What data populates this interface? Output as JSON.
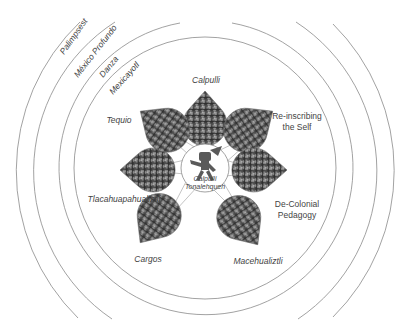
{
  "diagram": {
    "rings": [
      {
        "label": "Mexicayotl",
        "radius": 131
      },
      {
        "label": "Danza",
        "radius": 147
      },
      {
        "label": "México Profundo",
        "radius": 178
      },
      {
        "label": "Palimpsest",
        "radius": 206
      }
    ],
    "center": {
      "line1": "Calpulli",
      "line2": "Tonalehqueh",
      "icon": "aztec-dancer-glyph"
    },
    "petals": [
      {
        "label": "Calpulli",
        "italic": true
      },
      {
        "label_line1": "Re-inscribing",
        "label_line2": "the Self",
        "italic": false
      },
      {
        "label_line1": "De-Colonial",
        "label_line2": "Pedagogy",
        "italic": false
      },
      {
        "label": "Macehualiztli",
        "italic": true
      },
      {
        "label": "Cargos",
        "italic": true
      },
      {
        "label": "Tlacahuapahualiztli",
        "italic": true
      },
      {
        "label": "Tequio",
        "italic": true
      }
    ],
    "colors": {
      "line": "#8a8a8a",
      "text": "#444444",
      "photo_dark": "#3a3a3a",
      "photo_mid": "#7a7a7a",
      "photo_light": "#bdbdbd"
    }
  }
}
